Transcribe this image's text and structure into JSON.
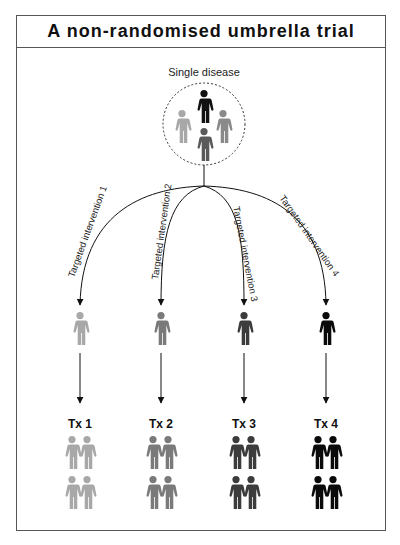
{
  "title": "A non-randomised umbrella trial",
  "source_group": {
    "label": "Single disease",
    "figures": [
      {
        "position": "top",
        "color": "#111111"
      },
      {
        "position": "left",
        "color": "#a8a8a8"
      },
      {
        "position": "right",
        "color": "#8a8a8a"
      },
      {
        "position": "bottom",
        "color": "#5a5a5a"
      }
    ]
  },
  "arms": [
    {
      "intervention": "Targeted intervention 1",
      "treatment": "Tx 1",
      "color": "#a8a8a8"
    },
    {
      "intervention": "Targeted intervention 2",
      "treatment": "Tx 2",
      "color": "#7a7a7a"
    },
    {
      "intervention": "Targeted intervention 3",
      "treatment": "Tx 3",
      "color": "#3c3c3c"
    },
    {
      "intervention": "Targeted intervention 4",
      "treatment": "Tx 4",
      "color": "#0a0a0a"
    }
  ],
  "colors": {
    "border": "#555555",
    "line": "#111111",
    "background": "#ffffff"
  }
}
